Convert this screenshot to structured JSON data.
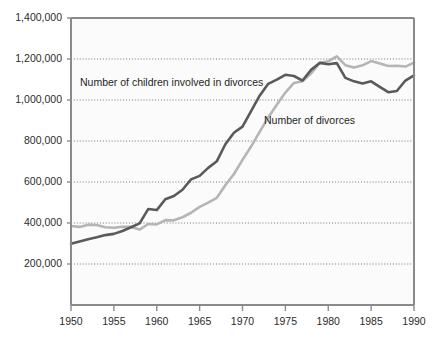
{
  "chart_data": {
    "type": "line",
    "title": "",
    "subtitle": "",
    "xlabel": "",
    "ylabel": "",
    "xlim": [
      1950,
      1990
    ],
    "ylim": [
      0,
      1400000
    ],
    "grid": true,
    "grid_axis": "y",
    "legend_position": "inline-annotations",
    "x_ticks": [
      1950,
      1955,
      1960,
      1965,
      1970,
      1975,
      1980,
      1985,
      1990
    ],
    "x_tick_labels": [
      "1950",
      "1955",
      "1960",
      "1965",
      "1970",
      "1975",
      "1980",
      "1985",
      "1990"
    ],
    "y_ticks": [
      200000,
      400000,
      600000,
      800000,
      1000000,
      1200000,
      1400000
    ],
    "y_tick_labels": [
      "200,000",
      "400,000",
      "600,000",
      "800,000",
      "1,000,000",
      "1,200,000",
      "1,400,000"
    ],
    "x": [
      1950,
      1951,
      1952,
      1953,
      1954,
      1955,
      1956,
      1957,
      1958,
      1959,
      1960,
      1961,
      1962,
      1963,
      1964,
      1965,
      1966,
      1967,
      1968,
      1969,
      1970,
      1971,
      1972,
      1973,
      1974,
      1975,
      1976,
      1977,
      1978,
      1979,
      1980,
      1981,
      1982,
      1983,
      1984,
      1985,
      1986,
      1987,
      1988,
      1989,
      1990
    ],
    "series": [
      {
        "name": "Number of children involved in divorces",
        "color": "#5a5a5a",
        "values": [
          299000,
          310000,
          321000,
          330000,
          341000,
          347000,
          361000,
          379000,
          398000,
          468000,
          463000,
          516000,
          532000,
          562000,
          613000,
          630000,
          669000,
          701000,
          784000,
          840000,
          870000,
          946000,
          1021000,
          1079000,
          1099000,
          1123000,
          1117000,
          1095000,
          1147000,
          1181000,
          1174000,
          1180000,
          1108000,
          1091000,
          1081000,
          1091000,
          1064000,
          1038000,
          1044000,
          1095000,
          1120000
        ]
      },
      {
        "name": "Number of divorces",
        "color": "#b5b5b5",
        "values": [
          385000,
          381000,
          392000,
          390000,
          379000,
          377000,
          382000,
          381000,
          368000,
          395000,
          393000,
          414000,
          413000,
          428000,
          450000,
          479000,
          499000,
          523000,
          584000,
          639000,
          708000,
          773000,
          845000,
          915000,
          977000,
          1036000,
          1083000,
          1091000,
          1130000,
          1181000,
          1189000,
          1213000,
          1170000,
          1158000,
          1169000,
          1190000,
          1178000,
          1166000,
          1167000,
          1163000,
          1182000
        ]
      }
    ],
    "annotations": [
      {
        "text": "Number of children involved in divorces",
        "x_px": 80,
        "y_px": 86,
        "series": "Number of children involved in divorces"
      },
      {
        "text": "Number of divorces",
        "x_px": 264,
        "y_px": 124,
        "series": "Number of divorces"
      }
    ],
    "colors": {
      "children_series": "#5a5a5a",
      "divorces_series": "#b5b5b5",
      "axis": "#8a8a8a",
      "gridline": "#555555",
      "plot_background": "#fbfbfb",
      "text": "#2b2b2b"
    }
  }
}
